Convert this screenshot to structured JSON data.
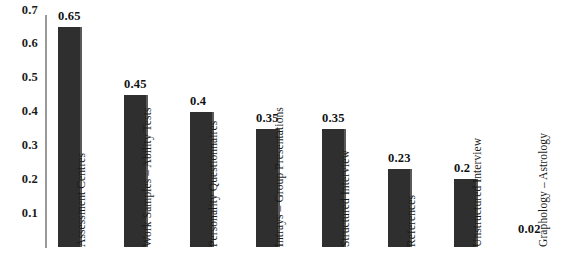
{
  "chart_data": {
    "type": "bar",
    "title": "",
    "subtitle": "",
    "xlabel": "",
    "ylabel": "",
    "grid": false,
    "legend": "none",
    "orientation": "vertical",
    "bar_color": "#2f2f2f",
    "axis_color": "#9a9a9a",
    "ylim": [
      0,
      0.7
    ],
    "yticks": [
      "0.1",
      "0.2",
      "0.3",
      "0.4",
      "0.5",
      "0.6",
      "0.7"
    ],
    "ytick_values": [
      0.1,
      0.2,
      0.3,
      0.4,
      0.5,
      0.6,
      0.7
    ],
    "categories": [
      "Assessment Centres",
      "Work Samples – Ability Tests",
      "Personality Questionnaires",
      "Intrays – Group Presentations",
      "Structured Interview",
      "References",
      "Unstructured Interview",
      "Graphology – Astrology"
    ],
    "values": [
      0.65,
      0.45,
      0.4,
      0.35,
      0.35,
      0.23,
      0.2,
      0.02
    ],
    "value_labels": [
      "0.65",
      "0.45",
      "0.4",
      "0.35",
      "0.35",
      "0.23",
      "0.2",
      "0.02"
    ]
  }
}
